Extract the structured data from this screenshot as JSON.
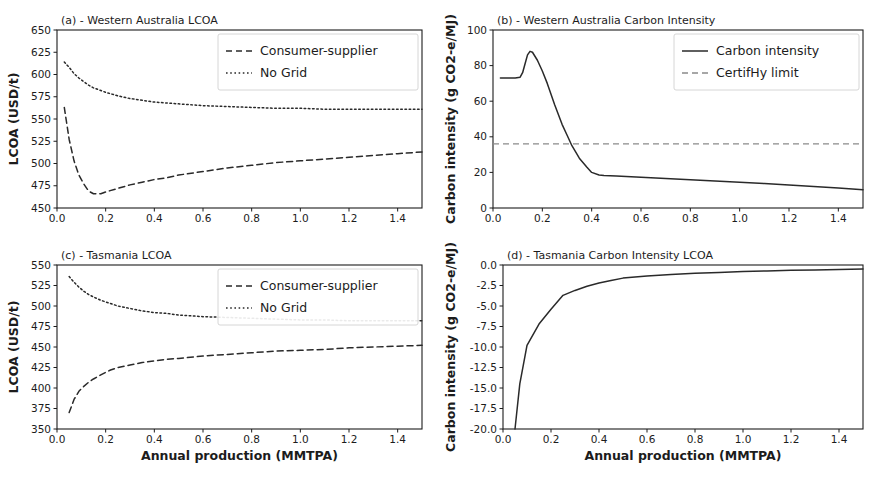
{
  "figure": {
    "background": "#ffffff",
    "line_color": "#2a2a2a",
    "limit_color": "#8a8a8a"
  },
  "chart_data": [
    {
      "id": "a",
      "type": "line",
      "title": "(a) - Western Australia LCOA",
      "xlabel": "",
      "ylabel": "LCOA (USD/t)",
      "xlim": [
        0.0,
        1.5
      ],
      "ylim": [
        450,
        650
      ],
      "xticks": [
        0.0,
        0.2,
        0.4,
        0.6,
        0.8,
        1.0,
        1.2,
        1.4
      ],
      "xticklabels": [
        "0.0",
        "0.2",
        "0.4",
        "0.6",
        "0.8",
        "1.0",
        "1.2",
        "1.4"
      ],
      "yticks": [
        450,
        475,
        500,
        525,
        550,
        575,
        600,
        625,
        650
      ],
      "yticklabels": [
        "450",
        "475",
        "500",
        "525",
        "550",
        "575",
        "600",
        "625",
        "650"
      ],
      "grid": false,
      "legend_position": "upper right",
      "x": [
        0.03,
        0.05,
        0.07,
        0.09,
        0.11,
        0.13,
        0.15,
        0.18,
        0.2,
        0.25,
        0.3,
        0.35,
        0.4,
        0.45,
        0.5,
        0.6,
        0.7,
        0.8,
        0.9,
        1.0,
        1.1,
        1.2,
        1.3,
        1.4,
        1.5
      ],
      "series": [
        {
          "name": "Consumer-supplier",
          "style": "dashed",
          "values": [
            563,
            527,
            503,
            487,
            477,
            469,
            466,
            466,
            468,
            472,
            476,
            479,
            482,
            484,
            487,
            491,
            495,
            498,
            501,
            503,
            505,
            507,
            509,
            511,
            513
          ]
        },
        {
          "name": "No Grid",
          "style": "dotted",
          "values": [
            614,
            608,
            601,
            596,
            592,
            588,
            585,
            582,
            580,
            576,
            573,
            571,
            569,
            568,
            567,
            565,
            564,
            563,
            562,
            562,
            561,
            561,
            561,
            561,
            561
          ]
        }
      ]
    },
    {
      "id": "b",
      "type": "line",
      "title": "(b) - Western Australia Carbon Intensity",
      "xlabel": "",
      "ylabel": "Carbon intensity (g CO2-e/MJ)",
      "xlim": [
        0.0,
        1.5
      ],
      "ylim": [
        0,
        100
      ],
      "xticks": [
        0.0,
        0.2,
        0.4,
        0.6,
        0.8,
        1.0,
        1.2,
        1.4
      ],
      "xticklabels": [
        "0.0",
        "0.2",
        "0.4",
        "0.6",
        "0.8",
        "1.0",
        "1.2",
        "1.4"
      ],
      "yticks": [
        0,
        20,
        40,
        60,
        80,
        100
      ],
      "yticklabels": [
        "0",
        "20",
        "40",
        "60",
        "80",
        "100"
      ],
      "grid": false,
      "legend_position": "upper right",
      "x": [
        0.03,
        0.06,
        0.09,
        0.11,
        0.12,
        0.13,
        0.14,
        0.15,
        0.16,
        0.18,
        0.2,
        0.22,
        0.25,
        0.28,
        0.3,
        0.32,
        0.35,
        0.38,
        0.4,
        0.43,
        0.45,
        0.5,
        0.6,
        0.7,
        0.8,
        0.9,
        1.0,
        1.1,
        1.2,
        1.3,
        1.4,
        1.5
      ],
      "series": [
        {
          "name": "Carbon intensity",
          "style": "solid",
          "values": [
            73,
            73,
            73,
            73.5,
            76,
            81,
            86,
            88,
            87.5,
            83,
            77,
            70,
            58,
            47,
            41,
            35,
            28,
            23,
            20,
            18.5,
            18.2,
            18,
            17.3,
            16.6,
            15.9,
            15.2,
            14.5,
            13.7,
            12.9,
            12.1,
            11.2,
            10.3
          ]
        }
      ],
      "hlines": [
        {
          "name": "CertifHy limit",
          "value": 36,
          "style": "dashed",
          "color": "#8a8a8a"
        }
      ]
    },
    {
      "id": "c",
      "type": "line",
      "title": "(c) - Tasmania LCOA",
      "xlabel": "Annual production (MMTPA)",
      "ylabel": "LCOA (USD/t)",
      "xlim": [
        0.0,
        1.5
      ],
      "ylim": [
        350,
        550
      ],
      "xticks": [
        0.0,
        0.2,
        0.4,
        0.6,
        0.8,
        1.0,
        1.2,
        1.4
      ],
      "xticklabels": [
        "0.0",
        "0.2",
        "0.4",
        "0.6",
        "0.8",
        "1.0",
        "1.2",
        "1.4"
      ],
      "yticks": [
        350,
        375,
        400,
        425,
        450,
        475,
        500,
        525,
        550
      ],
      "yticklabels": [
        "350",
        "375",
        "400",
        "425",
        "450",
        "475",
        "500",
        "525",
        "550"
      ],
      "grid": false,
      "legend_position": "upper right",
      "x": [
        0.05,
        0.07,
        0.09,
        0.11,
        0.13,
        0.15,
        0.18,
        0.2,
        0.22,
        0.25,
        0.3,
        0.35,
        0.4,
        0.45,
        0.5,
        0.6,
        0.7,
        0.8,
        0.9,
        1.0,
        1.1,
        1.2,
        1.3,
        1.4,
        1.5
      ],
      "series": [
        {
          "name": "Consumer-supplier",
          "style": "dashed",
          "values": [
            370,
            386,
            396,
            402,
            407,
            411,
            416,
            419,
            422,
            425,
            428,
            431,
            433,
            435,
            436,
            439,
            441,
            443,
            445,
            446,
            447,
            449,
            450,
            451,
            452
          ]
        },
        {
          "name": "No Grid",
          "style": "dotted",
          "values": [
            536,
            529,
            523,
            518,
            514,
            511,
            507,
            505,
            503,
            500,
            497,
            494,
            492,
            491,
            489,
            487,
            486,
            485,
            484,
            483,
            483,
            482,
            482,
            482,
            482
          ]
        }
      ]
    },
    {
      "id": "d",
      "type": "line",
      "title": "(d) - Tasmania Carbon Intensity LCOA",
      "xlabel": "Annual production (MMTPA)",
      "ylabel": "Carbon intensity (g CO2-e/MJ)",
      "xlim": [
        0.0,
        1.5
      ],
      "ylim": [
        -20.0,
        0.0
      ],
      "xticks": [
        0.0,
        0.2,
        0.4,
        0.6,
        0.8,
        1.0,
        1.2,
        1.4
      ],
      "xticklabels": [
        "0.0",
        "0.2",
        "0.4",
        "0.6",
        "0.8",
        "1.0",
        "1.2",
        "1.4"
      ],
      "yticks": [
        -20.0,
        -17.5,
        -15.0,
        -12.5,
        -10.0,
        -7.5,
        -5.0,
        -2.5,
        0.0
      ],
      "yticklabels": [
        "-20.0",
        "-17.5",
        "-15.0",
        "-12.5",
        "-10.0",
        "-7.5",
        "-5.0",
        "-2.5",
        "0.0"
      ],
      "grid": false,
      "legend_position": "none",
      "x": [
        0.05,
        0.07,
        0.1,
        0.15,
        0.2,
        0.25,
        0.3,
        0.35,
        0.4,
        0.45,
        0.5,
        0.6,
        0.7,
        0.8,
        0.9,
        1.0,
        1.1,
        1.2,
        1.3,
        1.4,
        1.5
      ],
      "series": [
        {
          "name": "Carbon intensity",
          "style": "solid",
          "values": [
            -20.0,
            -14.5,
            -9.8,
            -7.2,
            -5.4,
            -3.7,
            -3.1,
            -2.6,
            -2.2,
            -1.9,
            -1.6,
            -1.35,
            -1.15,
            -1.0,
            -0.9,
            -0.8,
            -0.72,
            -0.65,
            -0.6,
            -0.55,
            -0.5
          ]
        }
      ]
    }
  ]
}
